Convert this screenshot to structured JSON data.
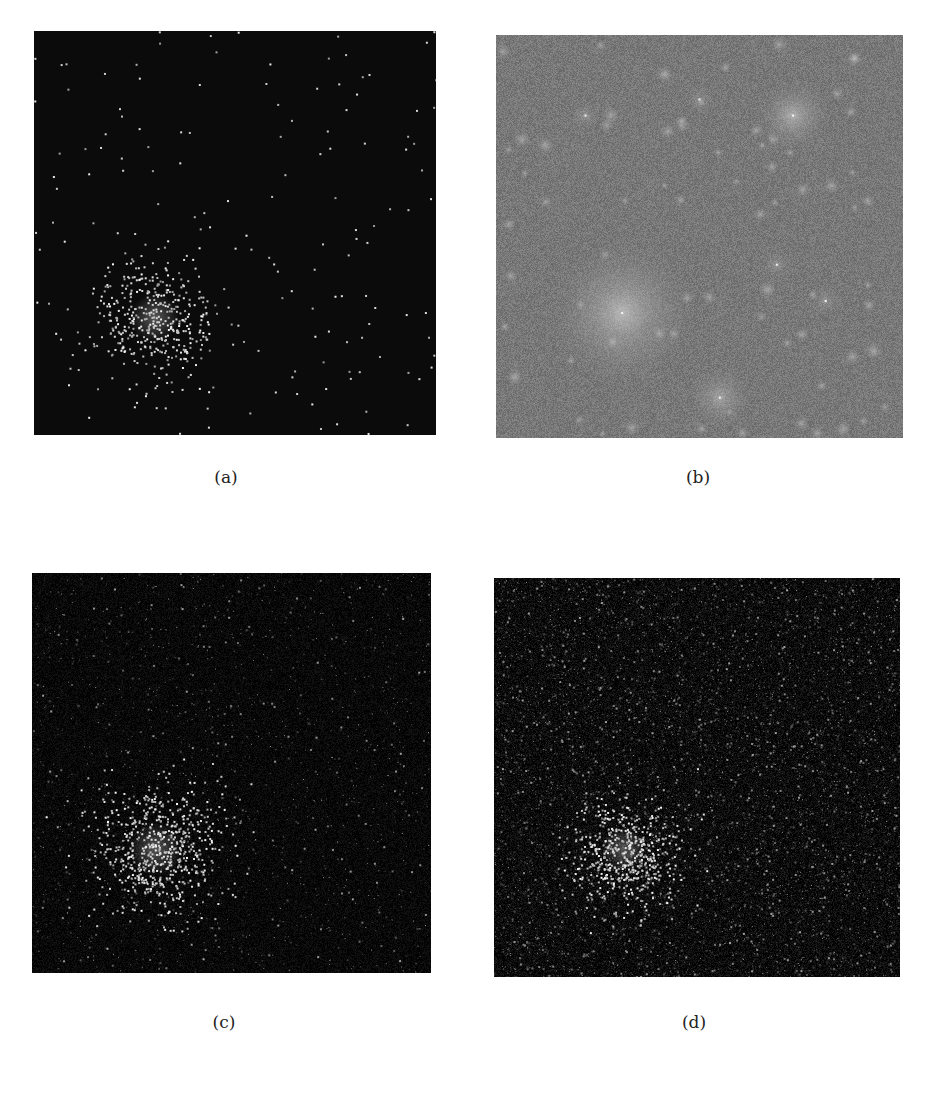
{
  "figure": {
    "panels": [
      {
        "id": "a",
        "label": "(a)",
        "box": {
          "x": 34,
          "y": 31,
          "w": 402,
          "h": 404
        },
        "caption_pos": {
          "x": 198,
          "y": 467
        },
        "background": "#0b0b0b",
        "style": "sparse-points",
        "seed": 11,
        "cluster": {
          "cx": 0.3,
          "cy": 0.71,
          "sigma": 0.075,
          "n": 420
        },
        "field_points": 170,
        "noise_level": 0
      },
      {
        "id": "b",
        "label": "(b)",
        "box": {
          "x": 496,
          "y": 35,
          "w": 407,
          "h": 403
        },
        "caption_pos": {
          "x": 670,
          "y": 467
        },
        "background": "#787878",
        "style": "blurred-blobs",
        "seed": 29,
        "blobs": [
          {
            "cx": 0.31,
            "cy": 0.69,
            "r": 0.18,
            "a": 0.55
          },
          {
            "cx": 0.73,
            "cy": 0.2,
            "r": 0.09,
            "a": 0.5
          },
          {
            "cx": 0.55,
            "cy": 0.9,
            "r": 0.08,
            "a": 0.4
          },
          {
            "cx": 0.22,
            "cy": 0.2,
            "r": 0.04,
            "a": 0.25
          },
          {
            "cx": 0.69,
            "cy": 0.57,
            "r": 0.04,
            "a": 0.25
          },
          {
            "cx": 0.81,
            "cy": 0.66,
            "r": 0.04,
            "a": 0.25
          },
          {
            "cx": 0.5,
            "cy": 0.16,
            "r": 0.04,
            "a": 0.22
          }
        ],
        "small_spots": 70,
        "noise_level": 18
      },
      {
        "id": "c",
        "label": "(c)",
        "box": {
          "x": 32,
          "y": 573,
          "w": 399,
          "h": 400
        },
        "caption_pos": {
          "x": 196,
          "y": 1012
        },
        "background": "#080808",
        "style": "noisy-points",
        "seed": 47,
        "cluster": {
          "cx": 0.31,
          "cy": 0.69,
          "sigma": 0.085,
          "n": 650
        },
        "field_points": 1400,
        "noise_level": 14
      },
      {
        "id": "d",
        "label": "(d)",
        "box": {
          "x": 494,
          "y": 578,
          "w": 406,
          "h": 399
        },
        "caption_pos": {
          "x": 666,
          "y": 1012
        },
        "background": "#0a0a0a",
        "style": "dense-noise",
        "seed": 83,
        "cluster": {
          "cx": 0.32,
          "cy": 0.68,
          "sigma": 0.07,
          "n": 520
        },
        "field_points": 5200,
        "noise_level": 22
      }
    ]
  }
}
